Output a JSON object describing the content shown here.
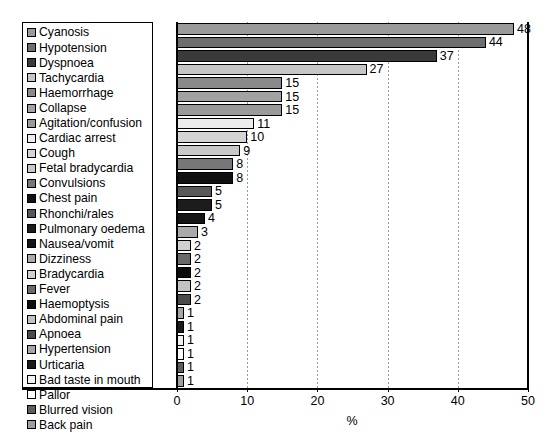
{
  "chart_data": {
    "type": "bar",
    "orientation": "horizontal",
    "title": "",
    "xlabel": "%",
    "ylabel": "",
    "xlim": [
      0,
      50
    ],
    "xticks": [
      0,
      10,
      20,
      30,
      40,
      50
    ],
    "grid": "vertical-dotted",
    "legend_position": "top-left-overlay",
    "categories": [
      "Cyanosis",
      "Hypotension",
      "Dyspnoea",
      "Tachycardia",
      "Haemorrhage",
      "Collapse",
      "Agitation/confusion",
      "Cardiac arrest",
      "Cough",
      "Fetal bradycardia",
      "Convulsions",
      "Chest pain",
      "Rhonchi/rales",
      "Pulmonary oedema",
      "Nausea/vomit",
      "Dizziness",
      "Bradycardia",
      "Fever",
      "Haemoptysis",
      "Abdominal pain",
      "Apnoea",
      "Hypertension",
      "Urticaria",
      "Bad taste in mouth",
      "Pallor",
      "Blurred vision",
      "Back pain"
    ],
    "values": [
      48,
      44,
      37,
      27,
      15,
      15,
      15,
      11,
      10,
      9,
      8,
      8,
      5,
      5,
      4,
      3,
      2,
      2,
      2,
      2,
      2,
      1,
      1,
      1,
      1,
      1,
      1
    ],
    "value_labels": [
      "48",
      "44",
      "37",
      "27",
      "15",
      "15",
      "15",
      "11",
      "10",
      "9",
      "8",
      "8",
      "5",
      "5",
      "4",
      "3",
      "2",
      "2",
      "2",
      "2",
      "2",
      "1",
      "1",
      "1",
      "1",
      "1",
      "1"
    ],
    "colors": [
      "#9a9a9a",
      "#6e6e6e",
      "#3a3a3a",
      "#c6c6c6",
      "#8a8a8a",
      "#a2a2a2",
      "#9a9a9a",
      "#ededed",
      "#d4d4d4",
      "#c8c8c8",
      "#777777",
      "#111111",
      "#585858",
      "#1c1c1c",
      "#141414",
      "#aaaaaa",
      "#d0d0d0",
      "#6a6a6a",
      "#0d0d0d",
      "#c2c2c2",
      "#4a4a4a",
      "#a6a6a6",
      "#1a1a1a",
      "#f2f2f2",
      "#fdfdfd",
      "#5e5e5e",
      "#9e9e9e"
    ]
  },
  "axis": {
    "tick_labels": [
      "0",
      "10",
      "20",
      "30",
      "40",
      "50"
    ],
    "x_axis_title": "%"
  }
}
